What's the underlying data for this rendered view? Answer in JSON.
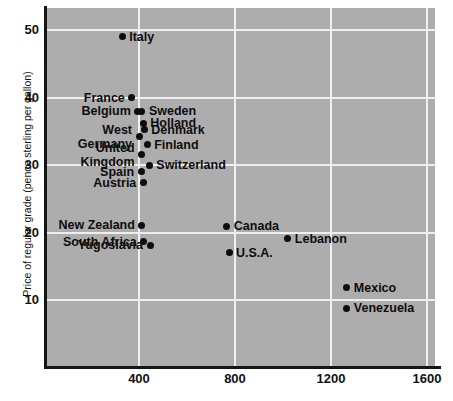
{
  "chart_data": {
    "type": "scatter",
    "title": "",
    "xlabel": "",
    "ylabel": "Price of regular grade (pence sterling per gallon)",
    "xlim": [
      0,
      1660
    ],
    "ylim": [
      3.8,
      53.2
    ],
    "xticks": [
      400,
      800,
      1200,
      1600
    ],
    "yticks": [
      10,
      20,
      30,
      40,
      50
    ],
    "grid": true,
    "legend": false,
    "plot_background": "#adadad",
    "gridline_color": "#efefef",
    "point_color": "#0d0d0d",
    "points": [
      {
        "label": "Italy",
        "x": 330,
        "y": 49.0,
        "side": "right"
      },
      {
        "label": "France",
        "x": 370,
        "y": 40.0,
        "side": "left"
      },
      {
        "label": "Belgium",
        "x": 395,
        "y": 38.0,
        "side": "left"
      },
      {
        "label": "Sweden",
        "x": 412,
        "y": 38.0,
        "side": "right"
      },
      {
        "label": "Holland",
        "x": 418,
        "y": 36.2,
        "side": "right"
      },
      {
        "label": "West",
        "x": 400,
        "y": 34.2,
        "side": "left"
      },
      {
        "label": "Germany",
        "x": 400,
        "y": 34.2,
        "side": "left"
      },
      {
        "label": "Denmark",
        "x": 422,
        "y": 35.2,
        "side": "right"
      },
      {
        "label": "Finland",
        "x": 434,
        "y": 33.0,
        "side": "right"
      },
      {
        "label": "United",
        "x": 411,
        "y": 31.5,
        "side": "left"
      },
      {
        "label": "Kingdom",
        "x": 411,
        "y": 31.5,
        "side": "left"
      },
      {
        "label": "Switzerland",
        "x": 443,
        "y": 30.0,
        "side": "right"
      },
      {
        "label": "Spain",
        "x": 409,
        "y": 29.0,
        "side": "left"
      },
      {
        "label": "Austria",
        "x": 418,
        "y": 27.4,
        "side": "left"
      },
      {
        "label": "New Zealand",
        "x": 412,
        "y": 21.1,
        "side": "left"
      },
      {
        "label": "South Africa",
        "x": 420,
        "y": 18.6,
        "side": "left"
      },
      {
        "label": "Yugoslavia",
        "x": 446,
        "y": 18.1,
        "side": "left"
      },
      {
        "label": "Canada",
        "x": 766,
        "y": 20.9,
        "side": "right"
      },
      {
        "label": "Lebanon",
        "x": 1020,
        "y": 19.1,
        "side": "right"
      },
      {
        "label": "U.S.A.",
        "x": 775,
        "y": 17.0,
        "side": "right"
      },
      {
        "label": "Mexico",
        "x": 1266,
        "y": 11.8,
        "side": "right"
      },
      {
        "label": "Venezuela",
        "x": 1266,
        "y": 8.8,
        "side": "right"
      }
    ]
  },
  "axis": {
    "y_title": "Price of regular grade (pence sterling per gallon)",
    "y_tick_labels": [
      "50",
      "40",
      "30",
      "20",
      "10"
    ],
    "x_tick_labels": [
      "400",
      "800",
      "1200",
      "1600"
    ]
  }
}
